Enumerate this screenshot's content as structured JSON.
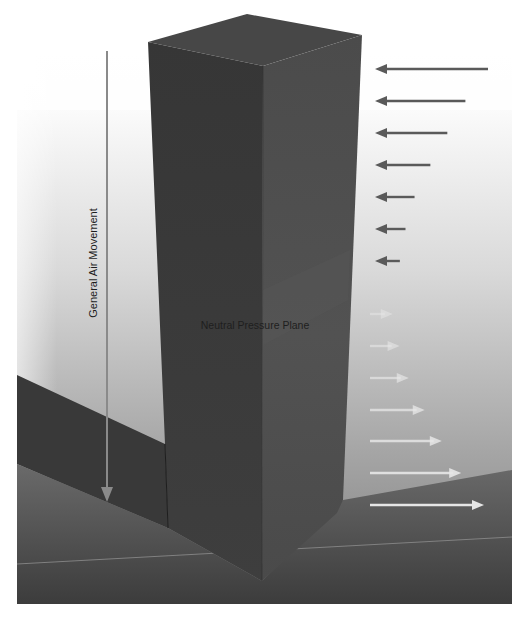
{
  "diagram": {
    "labels": {
      "general_air_movement": "General Air Movement",
      "neutral_pressure_plane": "Neutral Pressure Plane"
    },
    "incoming_arrows": {
      "direction": "left",
      "description": "Air infiltration above neutral pressure plane, decreasing toward plane",
      "relative_magnitudes": [
        1.0,
        0.8,
        0.64,
        0.49,
        0.35,
        0.27,
        0.22
      ],
      "color": "#5a5a5a"
    },
    "outgoing_arrows": {
      "direction": "right",
      "description": "Air exfiltration below neutral pressure plane, increasing toward ground",
      "relative_magnitudes": [
        0.2,
        0.26,
        0.34,
        0.48,
        0.63,
        0.8,
        1.0
      ],
      "color": "#e6e6e6"
    },
    "general_air_movement_arrow": {
      "direction": "down",
      "color": "#8a8a8a"
    },
    "colors": {
      "building_left_face": "#3b3b3b",
      "building_right_face": "#4d4d4d",
      "building_top": "#474747",
      "low_wing": "#3a3a3a",
      "ground": "#4a4a4a",
      "horizon_line": "#8e8e8e"
    }
  }
}
